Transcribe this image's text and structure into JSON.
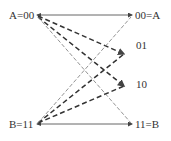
{
  "nodes": {
    "a_left": "A=00",
    "a_right": "00=A",
    "mid_01": "01",
    "mid_10": "10",
    "b_left": "B=11",
    "b_right": "11=B"
  },
  "edges": [
    {
      "from": "A=00",
      "to": "00=A",
      "style": "solid"
    },
    {
      "from": "A=00",
      "to": "01",
      "style": "thick-dashed"
    },
    {
      "from": "A=00",
      "to": "10",
      "style": "thick-dashed"
    },
    {
      "from": "A=00",
      "to": "11=B",
      "style": "thin-dashed"
    },
    {
      "from": "B=11",
      "to": "11=B",
      "style": "solid"
    },
    {
      "from": "B=11",
      "to": "01",
      "style": "thick-dashed"
    },
    {
      "from": "B=11",
      "to": "10",
      "style": "thick-dashed"
    },
    {
      "from": "B=11",
      "to": "00=A",
      "style": "thin-dashed"
    }
  ],
  "colors": {
    "line": "#555555",
    "dash": "#333333",
    "thin": "#777777"
  }
}
